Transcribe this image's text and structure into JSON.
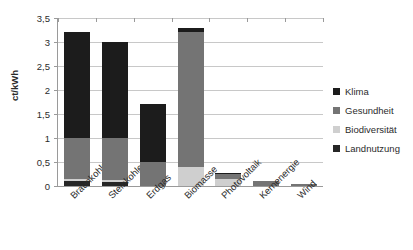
{
  "chart_data": {
    "type": "bar",
    "subtype": "stacked-vertical",
    "title": "",
    "xlabel": "",
    "ylabel": "ct/kWh",
    "ylim": [
      0,
      3.5
    ],
    "ytick_labels": [
      "0",
      "0,5",
      "1",
      "1,5",
      "2",
      "2,5",
      "3",
      "3,5"
    ],
    "ytick_values": [
      0,
      0.5,
      1,
      1.5,
      2,
      2.5,
      3,
      3.5
    ],
    "grid": "horizontal",
    "legend_position": "right",
    "categories": [
      "Braunkohle",
      "Steinkohle",
      "Erdgas",
      "Biomasse",
      "Photovoltaik",
      "Kernenergie",
      "Wind"
    ],
    "series": [
      {
        "name": "Landnutzung",
        "color": "#262626",
        "values": [
          0.1,
          0.09,
          0,
          0,
          0,
          0,
          0
        ]
      },
      {
        "name": "Biodiversität",
        "color": "#cfcfcf",
        "values": [
          0.05,
          0.04,
          0,
          0.4,
          0.14,
          0,
          0
        ]
      },
      {
        "name": "Gesundheit",
        "color": "#747474",
        "values": [
          0.85,
          0.87,
          0.5,
          2.8,
          0.1,
          0.1,
          0.04
        ]
      },
      {
        "name": "Klima",
        "color": "#1c1c1c",
        "values": [
          2.2,
          2.0,
          1.2,
          0.1,
          0.04,
          0.01,
          0.005
        ]
      }
    ],
    "totals": [
      3.2,
      3.0,
      1.7,
      3.3,
      0.28,
      0.11,
      0.045
    ]
  },
  "legend": {
    "items": [
      {
        "label": "Klima",
        "color": "#1c1c1c"
      },
      {
        "label": "Gesundheit",
        "color": "#747474"
      },
      {
        "label": "Biodiversität",
        "color": "#cfcfcf"
      },
      {
        "label": "Landnutzung",
        "color": "#262626"
      }
    ]
  },
  "axes": {
    "y_title": "ct/kWh"
  }
}
